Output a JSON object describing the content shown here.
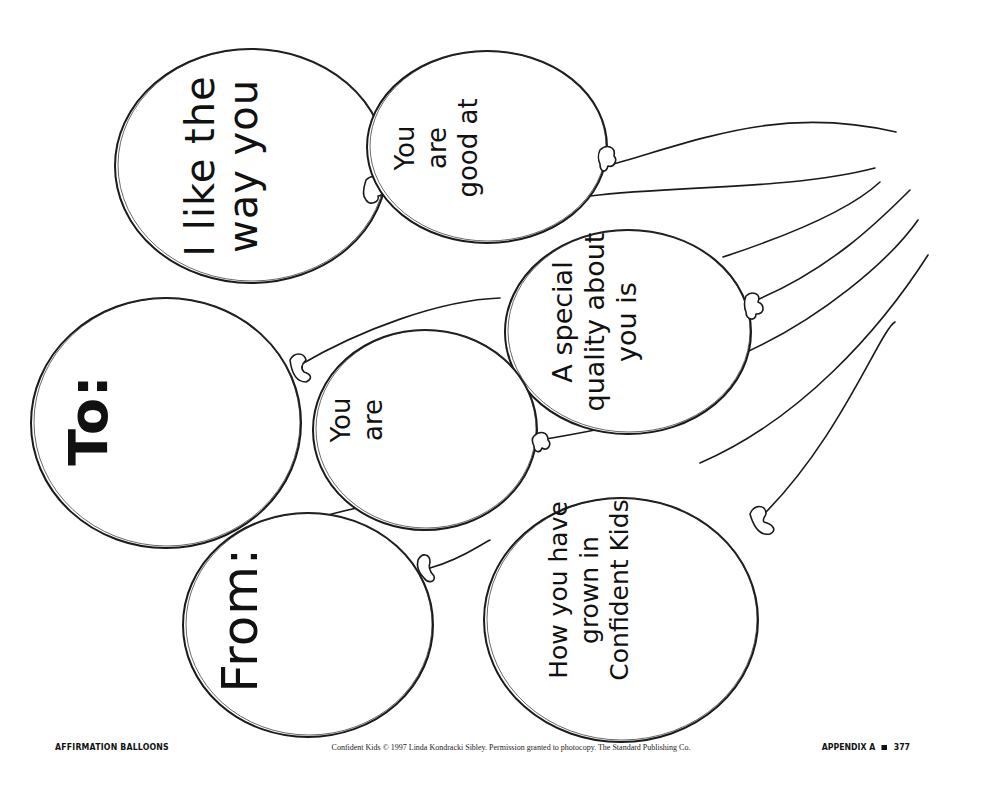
{
  "document": {
    "title": "Affirmation Balloons",
    "style": "hand-drawn line art worksheet, printed page"
  },
  "balloons": [
    {
      "id": "like-the-way",
      "lines": [
        "I like the",
        "way you"
      ]
    },
    {
      "id": "good-at",
      "lines": [
        "You",
        "are",
        "good at"
      ]
    },
    {
      "id": "special-quality",
      "lines": [
        "A special",
        "quality about",
        "you is"
      ]
    },
    {
      "id": "to",
      "lines": [
        "To:"
      ]
    },
    {
      "id": "you-are",
      "lines": [
        "You",
        "are"
      ]
    },
    {
      "id": "from",
      "lines": [
        "From:"
      ]
    },
    {
      "id": "grown",
      "lines": [
        "How you have",
        "grown in",
        "Confident Kids"
      ]
    }
  ],
  "footer": {
    "left": "Affirmation Balloons",
    "center": "Confident Kids © 1997 Linda Kondracki Sibley. Permission granted to photocopy. The Standard Publishing Co.",
    "right_label": "Appendix A",
    "right_page": "377"
  },
  "colors": {
    "ink": "#1a1a1a",
    "paper": "#ffffff"
  }
}
